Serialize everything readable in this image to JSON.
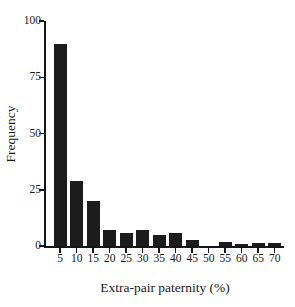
{
  "chart_data": {
    "type": "bar",
    "title": "",
    "xlabel": "Extra-pair paternity (%)",
    "ylabel": "Frequency",
    "categories": [
      "5",
      "10",
      "15",
      "20",
      "25",
      "30",
      "35",
      "40",
      "45",
      "50",
      "55",
      "60",
      "65",
      "70"
    ],
    "values": [
      90,
      29,
      20,
      7,
      6,
      7,
      5,
      6,
      2.5,
      0,
      2,
      0.7,
      1.5,
      1.5
    ],
    "ylim": [
      0,
      100
    ],
    "yticks": [
      0,
      25,
      50,
      75,
      100
    ],
    "ytick_labels": [
      "0",
      "25",
      "50",
      "75",
      "100"
    ],
    "xticks": [
      "5",
      "10",
      "15",
      "20",
      "25",
      "30",
      "35",
      "40",
      "45",
      "50",
      "55",
      "60",
      "65",
      "70"
    ],
    "grid": false,
    "legend": false,
    "bar_color": "#1c1c1c",
    "axis_color": "#151515",
    "background_color": "#ffffff"
  }
}
